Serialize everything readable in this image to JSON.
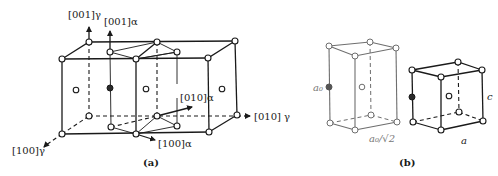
{
  "figure_a": {
    "caption": "(a)",
    "labels": {
      "z_gamma": "[001]γ",
      "z_alpha": "[001]α",
      "x_gamma": "[100]γ",
      "y_gamma": "[010] γ",
      "y_alpha": "[010]α",
      "x_alpha": "[100]α"
    }
  },
  "figure_b": {
    "caption": "(b)",
    "left_cell": {
      "height_label": "a₀",
      "base_label": "a₀/√2"
    },
    "right_cell": {
      "height_label": "c",
      "base_label": "a"
    }
  },
  "colors": {
    "line": "#1a1a1a",
    "light_line": "#6e6e6e",
    "background": "#ffffff"
  }
}
